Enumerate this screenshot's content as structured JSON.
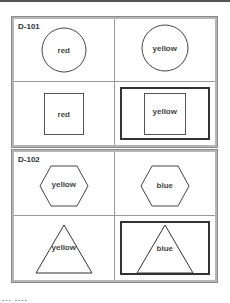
{
  "panels": [
    {
      "label": "D-101",
      "cells": [
        {
          "shape": "circle",
          "text": "red",
          "selected": false
        },
        {
          "shape": "circle",
          "text": "yellow",
          "selected": false
        },
        {
          "shape": "square",
          "text": "red",
          "selected": false
        },
        {
          "shape": "square",
          "text": "yellow",
          "selected": true
        }
      ]
    },
    {
      "label": "D-102",
      "cells": [
        {
          "shape": "hexagon",
          "text": "yellow",
          "selected": false
        },
        {
          "shape": "hexagon",
          "text": "blue",
          "selected": false
        },
        {
          "shape": "triangle",
          "text": "yellow",
          "selected": false
        },
        {
          "shape": "triangle",
          "text": "blue",
          "selected": true
        }
      ]
    }
  ],
  "footer_text": "...  ...."
}
